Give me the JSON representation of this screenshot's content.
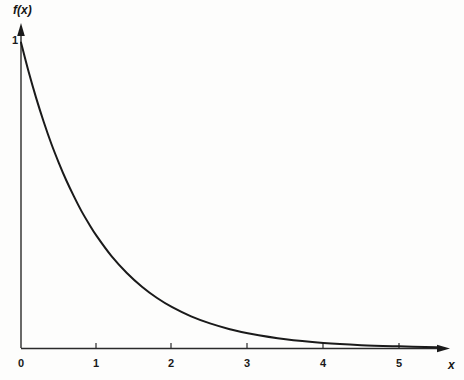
{
  "chart_data": {
    "type": "line",
    "title": "",
    "subtitle": "",
    "xlabel": "x",
    "ylabel": "f(x)",
    "grid": false,
    "legend": null,
    "xlim": [
      0,
      5.65
    ],
    "ylim": [
      0,
      1.08
    ],
    "xticks": [
      0,
      1,
      2,
      3,
      4,
      5
    ],
    "xtick_labels": [
      "0",
      "1",
      "2",
      "3",
      "4",
      "5"
    ],
    "yticks": [
      1
    ],
    "ytick_labels": [
      "1"
    ],
    "series": [
      {
        "name": "f(x) = e^-x",
        "x": [
          0,
          0.1,
          0.2,
          0.3,
          0.4,
          0.5,
          0.6,
          0.7,
          0.8,
          0.9,
          1,
          1.2,
          1.4,
          1.6,
          1.8,
          2,
          2.25,
          2.5,
          2.75,
          3,
          3.5,
          4,
          4.5,
          5,
          5.5
        ],
        "y": [
          1,
          0.905,
          0.819,
          0.741,
          0.67,
          0.607,
          0.549,
          0.497,
          0.449,
          0.407,
          0.368,
          0.301,
          0.247,
          0.202,
          0.165,
          0.135,
          0.105,
          0.082,
          0.064,
          0.05,
          0.03,
          0.018,
          0.011,
          0.007,
          0.004
        ]
      }
    ],
    "colors": {
      "curve": "#1a1a1a",
      "axis": "#2a2a2a",
      "background": "#fdfdfc",
      "text": "#161616"
    }
  },
  "labels": {
    "y_axis": "f(x)",
    "x_axis": "x",
    "y_tick_one": "1",
    "x_tick_0": "0",
    "x_tick_1": "1",
    "x_tick_2": "2",
    "x_tick_3": "3",
    "x_tick_4": "4",
    "x_tick_5": "5"
  }
}
